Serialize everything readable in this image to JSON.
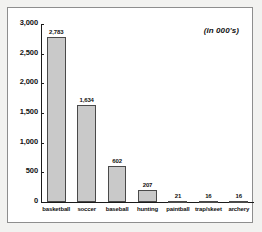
{
  "chart_data": {
    "type": "bar",
    "title": "",
    "subtitle": "",
    "annotation": "(in 000's)",
    "xlabel": "",
    "ylabel": "",
    "ylim": [
      0,
      3000
    ],
    "grid": false,
    "legend": null,
    "categories": [
      "basketball",
      "soccer",
      "baseball",
      "hunting",
      "paintball",
      "trap/skeet",
      "archery"
    ],
    "values": [
      2783,
      1634,
      602,
      207,
      21,
      16,
      16
    ],
    "value_labels": [
      "2,783",
      "1,634",
      "602",
      "207",
      "21",
      "16",
      "16"
    ],
    "ytick_labels": [
      "0",
      "500",
      "1,000",
      "1,500",
      "2,000",
      "2,500",
      "3,000"
    ],
    "ytick_values": [
      0,
      500,
      1000,
      1500,
      2000,
      2500,
      3000
    ],
    "bar_color": "#c9c9c9",
    "bar_border_color": "#4a4a4a",
    "axis_color": "#1a1a1a",
    "text_color": "#111111",
    "plot_background": "#ffffff",
    "figure_background": "#f2f2f0"
  }
}
